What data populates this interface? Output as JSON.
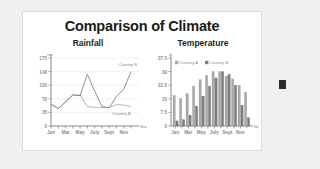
{
  "slide": {
    "title": "Comparison of Climate",
    "background_color": "#ffffff",
    "outer_color": "#eef0f1",
    "border_color": "#d8dadb",
    "handle_color": "#2b2b2b"
  },
  "series_colors": {
    "country_a": "#a9a9a9",
    "country_b": "#7d7d7d",
    "axis": "#7a7a7a",
    "grid": "#e6e6e6",
    "text": "#8a8a8a"
  },
  "chart_data": [
    {
      "type": "line",
      "title": "Rainfall",
      "xlabel": "Month",
      "ylabel": "mm",
      "ylim": [
        0,
        175
      ],
      "yticks": [
        0,
        35,
        70,
        105,
        140,
        175
      ],
      "ytick_labels": [
        "0",
        "35",
        "70",
        "105",
        "140",
        "175"
      ],
      "grid": true,
      "legend": "inline-labels",
      "x": [
        "Jan",
        "Feb",
        "Mar",
        "Apr",
        "May",
        "June",
        "July",
        "Aug",
        "Sept",
        "Oct",
        "Nov",
        "Dec"
      ],
      "xtick_labels": [
        "Jan",
        "Mar",
        "May",
        "July",
        "Sept",
        "Nov"
      ],
      "series": [
        {
          "name": "Country A",
          "label_position": "lower-right",
          "values": [
            56,
            45,
            62,
            80,
            80,
            50,
            48,
            47,
            48,
            55,
            54,
            50
          ]
        },
        {
          "name": "Country B",
          "label_position": "upper-right",
          "values": [
            56,
            45,
            62,
            80,
            78,
            133,
            90,
            50,
            47,
            76,
            95,
            140
          ]
        }
      ]
    },
    {
      "type": "bar",
      "title": "Temperature",
      "xlabel": "Month",
      "ylabel": "C",
      "ylim": [
        0,
        37.5
      ],
      "yticks": [
        0,
        7.5,
        15,
        22.5,
        30,
        37.5
      ],
      "ytick_labels": [
        "0",
        "7.5",
        "15",
        "22.5",
        "30",
        "37.5"
      ],
      "grid": false,
      "legend": [
        "Country A",
        "Country B"
      ],
      "legend_position": "top-left",
      "categories": [
        "Jan",
        "Feb",
        "Mar",
        "Apr",
        "May",
        "June",
        "July",
        "Aug",
        "Sept",
        "Oct",
        "Nov",
        "Dec"
      ],
      "xtick_labels": [
        "Jan",
        "Mar",
        "May",
        "July",
        "Sept",
        "Nov"
      ],
      "series": [
        {
          "name": "Country A",
          "values": [
            16.8,
            15.2,
            17.8,
            22.0,
            25.5,
            28.0,
            30.0,
            30.0,
            27.5,
            26.0,
            22.5,
            18.5
          ]
        },
        {
          "name": "Country B",
          "values": [
            2.8,
            3.5,
            6.0,
            11.0,
            16.5,
            22.0,
            26.5,
            30.0,
            28.5,
            22.5,
            11.5,
            4.5
          ]
        }
      ]
    }
  ]
}
